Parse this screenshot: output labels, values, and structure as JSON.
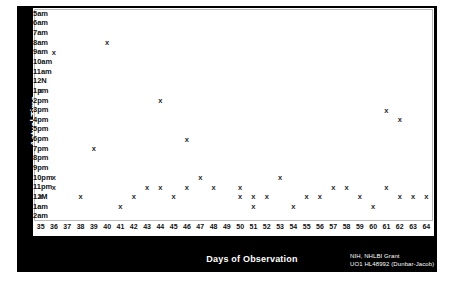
{
  "chart_data": {
    "type": "scatter",
    "title": "",
    "xlabel": "Days of Observation",
    "ylabel": "Actual Time",
    "marker": "x",
    "grid": false,
    "legend": null,
    "xlim": [
      34.5,
      64.5
    ],
    "x_ticks": [
      35,
      36,
      37,
      38,
      39,
      40,
      41,
      42,
      43,
      44,
      45,
      46,
      47,
      48,
      49,
      50,
      51,
      52,
      53,
      54,
      55,
      56,
      57,
      58,
      59,
      60,
      61,
      62,
      63,
      64
    ],
    "y_categories": [
      "5am",
      "6am",
      "7am",
      "8am",
      "9am",
      "10am",
      "11am",
      "12N",
      "1pm",
      "2pm",
      "3pm",
      "4pm",
      "5pm",
      "6pm",
      "7pm",
      "8pm",
      "9pm",
      "10pm",
      "11pm",
      "12M",
      "1am",
      "2am"
    ],
    "points": [
      {
        "x": 40,
        "y": "8am"
      },
      {
        "x": 36,
        "y": "9am"
      },
      {
        "x": 35,
        "y": "1pm"
      },
      {
        "x": 44,
        "y": "2pm"
      },
      {
        "x": 61,
        "y": "3pm"
      },
      {
        "x": 62,
        "y": "4pm"
      },
      {
        "x": 46,
        "y": "6pm"
      },
      {
        "x": 39,
        "y": "7pm"
      },
      {
        "x": 36,
        "y": "10pm"
      },
      {
        "x": 47,
        "y": "10pm"
      },
      {
        "x": 53,
        "y": "10pm"
      },
      {
        "x": 36,
        "y": "11pm"
      },
      {
        "x": 43,
        "y": "11pm"
      },
      {
        "x": 44,
        "y": "11pm"
      },
      {
        "x": 46,
        "y": "11pm"
      },
      {
        "x": 48,
        "y": "11pm"
      },
      {
        "x": 50,
        "y": "11pm"
      },
      {
        "x": 57,
        "y": "11pm"
      },
      {
        "x": 58,
        "y": "11pm"
      },
      {
        "x": 61,
        "y": "11pm"
      },
      {
        "x": 35,
        "y": "12M"
      },
      {
        "x": 38,
        "y": "12M"
      },
      {
        "x": 42,
        "y": "12M"
      },
      {
        "x": 45,
        "y": "12M"
      },
      {
        "x": 50,
        "y": "12M"
      },
      {
        "x": 51,
        "y": "12M"
      },
      {
        "x": 52,
        "y": "12M"
      },
      {
        "x": 55,
        "y": "12M"
      },
      {
        "x": 56,
        "y": "12M"
      },
      {
        "x": 59,
        "y": "12M"
      },
      {
        "x": 62,
        "y": "12M"
      },
      {
        "x": 63,
        "y": "12M"
      },
      {
        "x": 64,
        "y": "12M"
      },
      {
        "x": 41,
        "y": "1am"
      },
      {
        "x": 51,
        "y": "1am"
      },
      {
        "x": 54,
        "y": "1am"
      },
      {
        "x": 60,
        "y": "1am"
      }
    ]
  },
  "figure": {
    "y_axis_title": "Actual Time",
    "x_axis_title": "Days of Observation",
    "credit_line_1": "NIH, NHLBI  Grant",
    "credit_line_2": "UO1 HL48992 (Dunbar-Jacob)",
    "frame_color": "#000000",
    "plot_background": "#ffffff",
    "marker_color": "#2b2b2b"
  }
}
